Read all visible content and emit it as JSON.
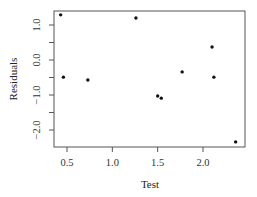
{
  "chart_data": {
    "type": "scatter",
    "title": "",
    "xlabel": "Test",
    "ylabel": "Residuals",
    "xlim": [
      0.38,
      2.42
    ],
    "ylim": [
      -2.45,
      1.4
    ],
    "xticks": [
      0.5,
      1.0,
      1.5,
      2.0
    ],
    "xtick_labels": [
      "0.5",
      "1.0",
      "1.5",
      "2.0"
    ],
    "yticks": [
      1.0,
      0.5,
      0.0,
      -0.5,
      -1.0,
      -1.5,
      -2.0
    ],
    "ytick_labels": [
      "1.0",
      "",
      "0.0",
      "",
      "-1.0",
      "",
      "-2.0"
    ],
    "grid": false,
    "legend": null,
    "points": [
      {
        "x": 0.43,
        "y": 1.29
      },
      {
        "x": 0.46,
        "y": -0.49
      },
      {
        "x": 0.73,
        "y": -0.57
      },
      {
        "x": 1.26,
        "y": 1.2
      },
      {
        "x": 1.5,
        "y": -1.03
      },
      {
        "x": 1.54,
        "y": -1.09
      },
      {
        "x": 1.77,
        "y": -0.34
      },
      {
        "x": 2.1,
        "y": 0.37
      },
      {
        "x": 2.12,
        "y": -0.49
      },
      {
        "x": 2.36,
        "y": -2.34
      }
    ],
    "point_color": "#111111",
    "axis_color": "#555555"
  }
}
